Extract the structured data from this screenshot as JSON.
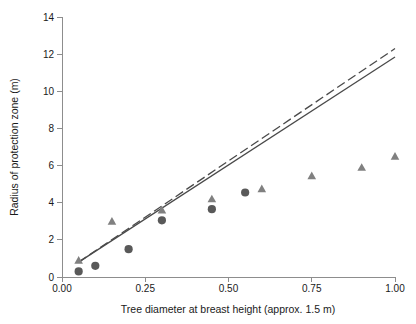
{
  "chart_data": {
    "type": "scatter",
    "title": "",
    "xlabel": "Tree diameter at breast height (approx. 1.5 m)",
    "ylabel": "Radius of protection zone (m)",
    "xlim": [
      0.0,
      1.0
    ],
    "ylim": [
      0,
      14
    ],
    "grid": false,
    "legend": "none",
    "xticks": [
      0.0,
      0.25,
      0.5,
      0.75,
      1.0
    ],
    "xtick_labels": [
      "0.00",
      "0.25",
      "0.50",
      "0.75",
      "1.00"
    ],
    "yticks": [
      0,
      2,
      4,
      6,
      8,
      10,
      12,
      14
    ],
    "ytick_labels": [
      "0",
      "2",
      "4",
      "6",
      "8",
      "10",
      "12",
      "14"
    ],
    "series": [
      {
        "name": "triangle-series",
        "marker": "triangle",
        "color": "#808080",
        "points": [
          {
            "x": 0.05,
            "y": 0.9
          },
          {
            "x": 0.15,
            "y": 3.0
          },
          {
            "x": 0.3,
            "y": 3.6
          },
          {
            "x": 0.45,
            "y": 4.2
          },
          {
            "x": 0.6,
            "y": 4.75
          },
          {
            "x": 0.75,
            "y": 5.45
          },
          {
            "x": 0.9,
            "y": 5.9
          },
          {
            "x": 1.0,
            "y": 6.5
          }
        ]
      },
      {
        "name": "circle-series",
        "marker": "circle",
        "color": "#595959",
        "points": [
          {
            "x": 0.05,
            "y": 0.3
          },
          {
            "x": 0.1,
            "y": 0.6
          },
          {
            "x": 0.2,
            "y": 1.5
          },
          {
            "x": 0.3,
            "y": 3.05
          },
          {
            "x": 0.45,
            "y": 3.65
          },
          {
            "x": 0.55,
            "y": 4.55
          }
        ]
      }
    ],
    "trendlines": [
      {
        "name": "solid-trendline",
        "style": "solid",
        "color": "#4a4a4a",
        "x0": 0.05,
        "y0": 0.8,
        "x1": 1.0,
        "y1": 11.85
      },
      {
        "name": "dashed-trendline",
        "style": "dashed",
        "color": "#4a4a4a",
        "x0": 0.05,
        "y0": 0.8,
        "x1": 1.0,
        "y1": 12.3
      }
    ]
  }
}
